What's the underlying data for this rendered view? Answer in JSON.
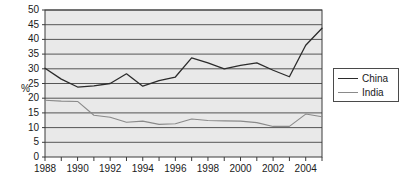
{
  "chart_data": {
    "type": "line",
    "title": "",
    "xlabel": "",
    "ylabel": "%",
    "ylim": [
      0,
      50
    ],
    "xlim": [
      1988,
      2005
    ],
    "yticks": [
      0,
      5,
      10,
      15,
      20,
      25,
      30,
      35,
      40,
      45,
      50
    ],
    "xticks": [
      1988,
      1990,
      1992,
      1994,
      1996,
      1998,
      2000,
      2002,
      2004
    ],
    "xtick_labels": [
      "1988",
      "1990",
      "1992",
      "1994",
      "1996",
      "1998",
      "2000",
      "2002",
      "2004"
    ],
    "ytick_labels": [
      "0",
      "5",
      "10",
      "15",
      "20",
      "25",
      "30",
      "35",
      "40",
      "45",
      "50"
    ],
    "grid": true,
    "grid_axis": "y",
    "legend_position": "right",
    "plot_background": "#e9e9e9",
    "grid_color": "#555555",
    "x": [
      1988,
      1989,
      1990,
      1991,
      1992,
      1993,
      1994,
      1995,
      1996,
      1997,
      1998,
      1999,
      2000,
      2001,
      2002,
      2003,
      2004,
      2005
    ],
    "series": [
      {
        "name": "China",
        "color": "#2b2b2b",
        "width": 1.3,
        "values": [
          30.2,
          26.5,
          23.8,
          24.2,
          25.0,
          28.3,
          24.1,
          26.0,
          27.2,
          33.7,
          32.0,
          30.0,
          31.2,
          32.0,
          29.5,
          27.3,
          38.0,
          43.8
        ]
      },
      {
        "name": "India",
        "color": "#8a8a8a",
        "width": 1.1,
        "values": [
          19.3,
          19.0,
          18.9,
          14.2,
          13.5,
          11.8,
          12.2,
          11.1,
          11.3,
          12.9,
          12.4,
          12.3,
          12.2,
          11.7,
          10.4,
          10.4,
          14.6,
          13.7
        ]
      }
    ]
  },
  "legend": {
    "items": [
      {
        "label": "China",
        "color": "#2b2b2b"
      },
      {
        "label": "India",
        "color": "#8a8a8a"
      }
    ]
  },
  "axes": {
    "y_axis_title": "%"
  }
}
